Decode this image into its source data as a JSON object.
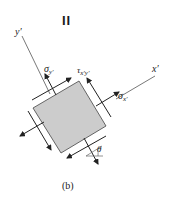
{
  "figure": {
    "marker": "II",
    "caption": "(b)",
    "axes": {
      "x_label": "x′",
      "y_label": "y′"
    },
    "stresses": {
      "normal_y": {
        "symbol": "σ",
        "subscript": "y′"
      },
      "shear": {
        "symbol": "τ",
        "subscript": "x′y′"
      },
      "normal_x": {
        "symbol": "σ",
        "subscript": "x′"
      }
    },
    "angle_label": "θ",
    "colors": {
      "element_fill": "#cccccc",
      "line": "#222222"
    }
  }
}
